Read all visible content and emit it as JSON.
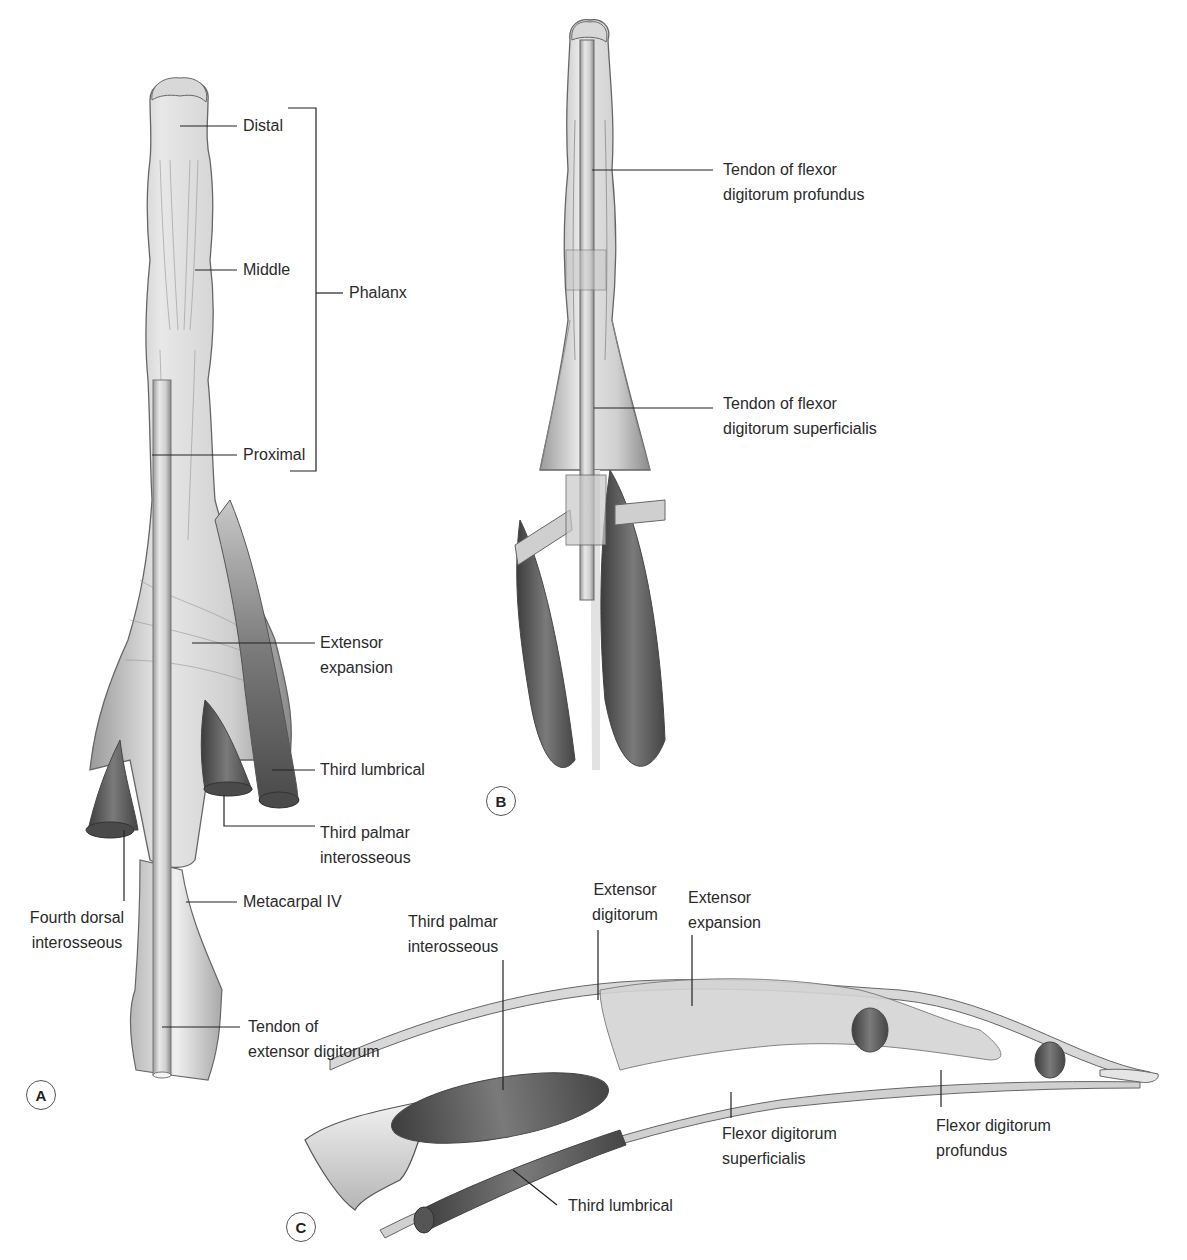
{
  "figure": {
    "panels": [
      {
        "id": "A",
        "badge": "A",
        "labels": {
          "distal": "Distal",
          "middle": "Middle",
          "proximal": "Proximal",
          "phalanx": "Phalanx",
          "extensor_expansion_1": "Extensor",
          "extensor_expansion_2": "expansion",
          "third_lumbrical": "Third lumbrical",
          "third_palmar_1": "Third palmar",
          "third_palmar_2": "interosseous",
          "fourth_dorsal_1": "Fourth dorsal",
          "fourth_dorsal_2": "interosseous",
          "metacarpal": "Metacarpal IV",
          "tendon_ext_1": "Tendon of",
          "tendon_ext_2": "extensor digitorum"
        }
      },
      {
        "id": "B",
        "badge": "B",
        "labels": {
          "fdp_1": "Tendon of flexor",
          "fdp_2": "digitorum profundus",
          "fds_1": "Tendon of flexor",
          "fds_2": "digitorum superficialis"
        }
      },
      {
        "id": "C",
        "badge": "C",
        "labels": {
          "palmar_1": "Third palmar",
          "palmar_2": "interosseous",
          "ext_dig_1": "Extensor",
          "ext_dig_2": "digitorum",
          "ext_exp_1": "Extensor",
          "ext_exp_2": "expansion",
          "fds_1": "Flexor digitorum",
          "fds_2": "superficialis",
          "fdp_1": "Flexor digitorum",
          "fdp_2": "profundus",
          "lumbrical": "Third lumbrical"
        }
      }
    ],
    "colors": {
      "tendon": "#dcdcdc",
      "tendon_stroke": "#6b6b6b",
      "muscle": "#6e6e6e",
      "muscle_dark": "#4a4a4a",
      "bone": "#ebebeb",
      "leader": "#222222"
    }
  }
}
